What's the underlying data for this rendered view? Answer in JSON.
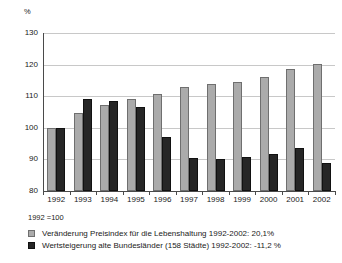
{
  "chart_data": {
    "type": "bar",
    "title": "",
    "xlabel": "",
    "ylabel": "%",
    "ylim": [
      80,
      130
    ],
    "yticks": [
      80,
      90,
      100,
      110,
      120,
      130
    ],
    "grid": true,
    "legend_position": "bottom-left",
    "base_note": "1992 =100",
    "categories": [
      "1992",
      "1993",
      "1994",
      "1995",
      "1996",
      "1997",
      "1998",
      "1999",
      "2000",
      "2001",
      "2002"
    ],
    "series": [
      {
        "name": "Veränderung Preisindex für die Lebenshaltung 1992-2002: 20,1%",
        "color": "#ababab",
        "values": [
          100,
          104.5,
          107.3,
          109.2,
          110.6,
          112.8,
          113.7,
          114.5,
          116.1,
          118.5,
          120.1
        ]
      },
      {
        "name": "Wertsteigerung alte Bundesländer (158 Städte) 1992-2002: -11,2 %",
        "color": "#262626",
        "values": [
          100,
          108.9,
          108.4,
          106.4,
          97.1,
          90.2,
          90.0,
          90.6,
          91.6,
          93.4,
          88.8
        ]
      }
    ]
  },
  "axis": {
    "unit": "%",
    "y_tick_labels": [
      "130",
      "120",
      "110",
      "100",
      "90",
      "80"
    ]
  },
  "legend": {
    "items": [
      {
        "label": "Veränderung Preisindex für die Lebenshaltung 1992-2002: 20,1%",
        "swatch": "gray"
      },
      {
        "label": "Wertsteigerung alte Bundesländer (158 Städte) 1992-2002: -11,2 %",
        "swatch": "dark"
      }
    ]
  }
}
